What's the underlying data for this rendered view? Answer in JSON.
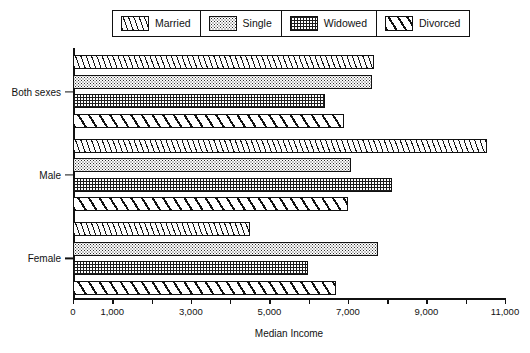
{
  "legend": {
    "position": "top-center",
    "items": [
      {
        "label": "Married",
        "pattern": "diagonal-hatch-left",
        "swatch_name": "legend-swatch-married"
      },
      {
        "label": "Single",
        "pattern": "fine-dots",
        "swatch_name": "legend-swatch-single"
      },
      {
        "label": "Widowed",
        "pattern": "cross-grid",
        "swatch_name": "legend-swatch-widowed"
      },
      {
        "label": "Divorced",
        "pattern": "bold-diagonal-hatch",
        "swatch_name": "legend-swatch-divorced"
      }
    ]
  },
  "axis": {
    "x_title": "Median Income",
    "x_ticks": [
      "0",
      "1,000",
      "3,000",
      "5,000",
      "7,000",
      "9,000",
      "11,000"
    ],
    "x_tick_values": [
      0,
      1000,
      3000,
      5000,
      7000,
      9000,
      11000
    ],
    "x_minor_tick_values": [
      2000,
      4000,
      6000,
      8000,
      10000
    ],
    "y_categories": [
      "Both sexes",
      "Male",
      "Female"
    ]
  },
  "chart_data": {
    "type": "bar",
    "orientation": "horizontal",
    "title": "",
    "subtitle": "",
    "xlabel": "Median Income",
    "ylabel": "",
    "xlim": [
      0,
      11000
    ],
    "grid": false,
    "legend_position": "top",
    "categories": [
      "Both sexes",
      "Male",
      "Female"
    ],
    "series": [
      {
        "name": "Married",
        "values": [
          7660,
          10540,
          4500
        ]
      },
      {
        "name": "Single",
        "values": [
          7610,
          7080,
          7770
        ]
      },
      {
        "name": "Widowed",
        "values": [
          6420,
          8120,
          5980
        ]
      },
      {
        "name": "Divorced",
        "values": [
          6900,
          7000,
          6700
        ]
      }
    ]
  }
}
